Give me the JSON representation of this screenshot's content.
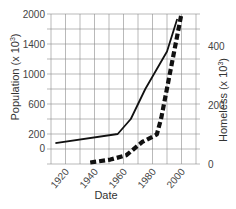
{
  "chart_data": {
    "type": "line",
    "title": "",
    "xlabel": "Date",
    "ylabel": "Population (x 10³)",
    "ylabel_right": "Homeless (x 10³)",
    "x_ticks": [
      1920,
      1940,
      1960,
      1980,
      2000
    ],
    "y_ticks_left": [
      2000,
      1400,
      1000,
      600,
      200,
      0
    ],
    "y_ticks_right": [
      400,
      200,
      0
    ],
    "xlim": [
      1910,
      2010
    ],
    "ylim_right": [
      0,
      500
    ],
    "grid": true,
    "legend": null,
    "series": [
      {
        "name": "Population",
        "axis": "left",
        "style": "solid",
        "x": [
          1913,
          1956,
          1965,
          1975,
          1990,
          1997
        ],
        "values": [
          70,
          200,
          400,
          800,
          1300,
          1900
        ]
      },
      {
        "name": "Homeless",
        "axis": "right",
        "style": "dashed",
        "x": [
          1937,
          1951,
          1962,
          1973,
          1983,
          1986,
          2000
        ],
        "values": [
          5,
          15,
          30,
          75,
          100,
          155,
          510
        ]
      }
    ]
  },
  "labels": {
    "xlabel": "Date",
    "ylabel_left": "Population (x 10",
    "ylabel_right": "Homeless (x 10",
    "superscript": "3",
    "ylabel_suffix": ")"
  },
  "colors": {
    "line": "#111111",
    "grid": "#8a8a8a",
    "text": "#444444"
  }
}
